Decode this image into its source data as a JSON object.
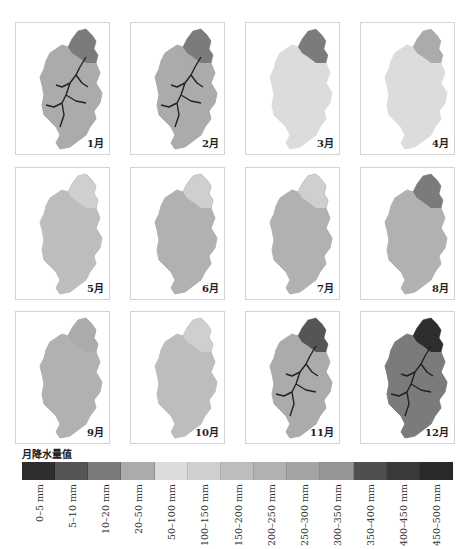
{
  "chart_data": {
    "type": "heatmap",
    "title": "",
    "panels": [
      {
        "label": "1月",
        "dominant_class": "20–50 mm",
        "dark_rivers": true,
        "north_class": "10–20 mm"
      },
      {
        "label": "2月",
        "dominant_class": "20–50 mm",
        "dark_rivers": true,
        "north_class": "10–20 mm"
      },
      {
        "label": "3月",
        "dominant_class": "50–100 mm",
        "dark_rivers": false,
        "north_class": "10–20 mm"
      },
      {
        "label": "4月",
        "dominant_class": "50–100 mm",
        "dark_rivers": false,
        "north_class": "20–50 mm"
      },
      {
        "label": "5月",
        "dominant_class": "150–200 mm",
        "dark_rivers": false,
        "north_class": "100–150 mm"
      },
      {
        "label": "6月",
        "dominant_class": "200–250 mm",
        "dark_rivers": false,
        "north_class": "100–150 mm"
      },
      {
        "label": "7月",
        "dominant_class": "200–250 mm",
        "dark_rivers": false,
        "north_class": "100–150 mm"
      },
      {
        "label": "8月",
        "dominant_class": "200–250 mm",
        "dark_rivers": false,
        "north_class": "10–20 mm"
      },
      {
        "label": "9月",
        "dominant_class": "200–250 mm",
        "dark_rivers": false,
        "north_class": "20–50 mm"
      },
      {
        "label": "10月",
        "dominant_class": "150–200 mm",
        "dark_rivers": false,
        "north_class": "100–150 mm"
      },
      {
        "label": "11月",
        "dominant_class": "20–50 mm",
        "dark_rivers": true,
        "north_class": "5–10 mm"
      },
      {
        "label": "12月",
        "dominant_class": "10–20 mm",
        "dark_rivers": true,
        "north_class": "0–5 mm"
      }
    ],
    "legend": {
      "title": "月降水量值",
      "position": "bottom",
      "classes": [
        "0–5 mm",
        "5–10 mm",
        "10–20 mm",
        "20–50 mm",
        "50–100 mm",
        "100–150 mm",
        "150–200 mm",
        "200–250 mm",
        "250–300 mm",
        "300–350 mm",
        "350–400 mm",
        "400–450 mm",
        "450–500 mm"
      ],
      "colors": [
        "#2e2e2e",
        "#555555",
        "#7b7b7b",
        "#ababab",
        "#dcdcdc",
        "#cfcfcf",
        "#bdbdbd",
        "#b1b1b1",
        "#a4a4a4",
        "#959595",
        "#4f4f4f",
        "#3a3a3a",
        "#2a2a2a"
      ]
    },
    "grid": false
  },
  "legend": {
    "title": "月降水量值",
    "labels": [
      "0–5 mm",
      "5–10 mm",
      "10–20 mm",
      "20–50 mm",
      "50–100 mm",
      "100–150 mm",
      "150–200 mm",
      "200–250 mm",
      "250–300 mm",
      "300–350 mm",
      "350–400 mm",
      "400–450 mm",
      "450–500 mm"
    ]
  },
  "months": [
    "1月",
    "2月",
    "3月",
    "4月",
    "5月",
    "6月",
    "7月",
    "8月",
    "9月",
    "10月",
    "11月",
    "12月"
  ]
}
